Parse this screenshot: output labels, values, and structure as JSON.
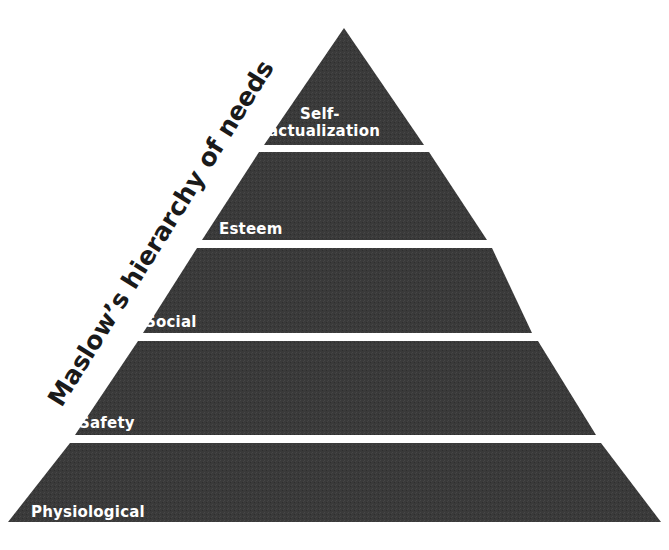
{
  "diagram": {
    "type": "pyramid",
    "title": "Maslow’s hierarchy of needs",
    "fill_color": "#3a3a3a",
    "gap_color": "#f4f4f4",
    "text_color": "#ffffff",
    "levels": [
      {
        "label_line1": "Self-",
        "label_line2": "actualization"
      },
      {
        "label": "Esteem"
      },
      {
        "label": "Social"
      },
      {
        "label": "Safety"
      },
      {
        "label": "Physiological"
      }
    ]
  }
}
